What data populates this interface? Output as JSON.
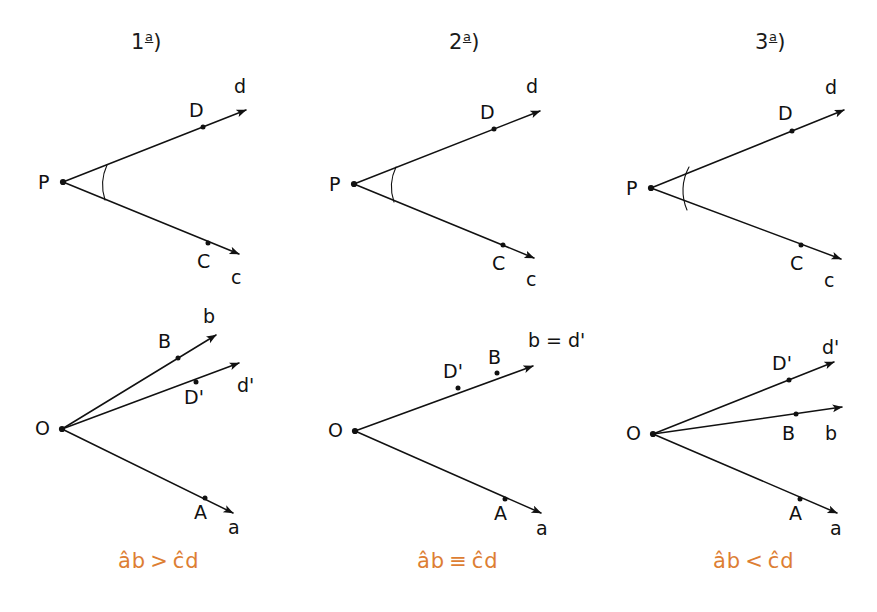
{
  "figure": {
    "type": "geometry-diagram",
    "background": "#ffffff",
    "ink_color": "#111111",
    "accent_color": "#dd7e33"
  },
  "columns": [
    {
      "id": "case-1",
      "heading_number": "1",
      "heading_ordinal": "a",
      "heading_paren": ")",
      "top": {
        "vertex_label": "P",
        "angle_name": "cd",
        "rays": [
          {
            "name": "d",
            "ray_label": "d",
            "point_label": "D"
          },
          {
            "name": "c",
            "ray_label": "c",
            "point_label": "C"
          }
        ]
      },
      "bottom": {
        "vertex_label": "O",
        "angle_name": "ab",
        "rays": [
          {
            "name": "b",
            "ray_label": "b",
            "point_label": "B"
          },
          {
            "name": "d-prime",
            "ray_label": "d'",
            "point_label": "D'"
          },
          {
            "name": "a",
            "ray_label": "a",
            "point_label": "A"
          }
        ]
      },
      "caption": {
        "left": "ab",
        "operator": ">",
        "right": "cd",
        "text": "âb > ĉd"
      }
    },
    {
      "id": "case-2",
      "heading_number": "2",
      "heading_ordinal": "a",
      "heading_paren": ")",
      "top": {
        "vertex_label": "P",
        "angle_name": "cd",
        "rays": [
          {
            "name": "d",
            "ray_label": "d",
            "point_label": "D"
          },
          {
            "name": "c",
            "ray_label": "c",
            "point_label": "C"
          }
        ]
      },
      "bottom": {
        "vertex_label": "O",
        "angle_name": "ab",
        "rays": [
          {
            "name": "b-equals-d-prime",
            "ray_label": "b = d'",
            "point_label": "B",
            "second_point_label": "D'"
          },
          {
            "name": "a",
            "ray_label": "a",
            "point_label": "A"
          }
        ]
      },
      "caption": {
        "left": "ab",
        "operator": "≡",
        "right": "cd",
        "text": "âb ≡ ĉd"
      }
    },
    {
      "id": "case-3",
      "heading_number": "3",
      "heading_ordinal": "a",
      "heading_paren": ")",
      "top": {
        "vertex_label": "P",
        "angle_name": "cd",
        "rays": [
          {
            "name": "d",
            "ray_label": "d",
            "point_label": "D"
          },
          {
            "name": "c",
            "ray_label": "c",
            "point_label": "C"
          }
        ]
      },
      "bottom": {
        "vertex_label": "O",
        "angle_name": "ab",
        "rays": [
          {
            "name": "d-prime",
            "ray_label": "d'",
            "point_label": "D'"
          },
          {
            "name": "b",
            "ray_label": "b",
            "point_label": "B"
          },
          {
            "name": "a",
            "ray_label": "a",
            "point_label": "A"
          }
        ]
      },
      "caption": {
        "left": "ab",
        "operator": "<",
        "right": "cd",
        "text": "âb < ĉd"
      }
    }
  ]
}
